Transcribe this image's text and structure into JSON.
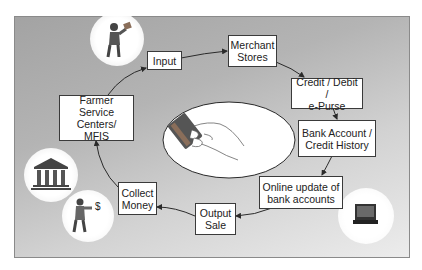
{
  "diagram": {
    "type": "cycle-flow",
    "nodes": [
      {
        "id": "input",
        "label": "Input"
      },
      {
        "id": "merchant",
        "label": "Merchant\nStores"
      },
      {
        "id": "credit",
        "label": "Credit / Debit /\ne-Purse"
      },
      {
        "id": "bank_account",
        "label": "Bank Account /\nCredit History"
      },
      {
        "id": "online_update",
        "label": "Online update of\nbank accounts"
      },
      {
        "id": "output_sale",
        "label": "Output\nSale"
      },
      {
        "id": "collect_money",
        "label": "Collect\nMoney"
      },
      {
        "id": "farmer_service",
        "label": "Farmer\nService Centers/\nMFIS"
      }
    ],
    "edges": [
      [
        "input",
        "merchant"
      ],
      [
        "merchant",
        "credit"
      ],
      [
        "credit",
        "bank_account"
      ],
      [
        "bank_account",
        "online_update"
      ],
      [
        "online_update",
        "output_sale"
      ],
      [
        "output_sale",
        "collect_money"
      ],
      [
        "collect_money",
        "farmer_service"
      ],
      [
        "farmer_service",
        "input"
      ]
    ],
    "illustrations": [
      {
        "name": "farmer-with-card-icon",
        "near": "input"
      },
      {
        "name": "hand-holding-card-illustration",
        "position": "center"
      },
      {
        "name": "bank-building-icon",
        "near": "farmer_service"
      },
      {
        "name": "farmer-with-money-icon",
        "symbol": "$",
        "near": "collect_money"
      },
      {
        "name": "computer-icon",
        "near": "online_update"
      }
    ]
  },
  "colors": {
    "frame_dark": "#a3a3a3",
    "frame_light": "#ececec",
    "box_border": "#3a3a3a",
    "arrow": "#2a2a2a"
  }
}
